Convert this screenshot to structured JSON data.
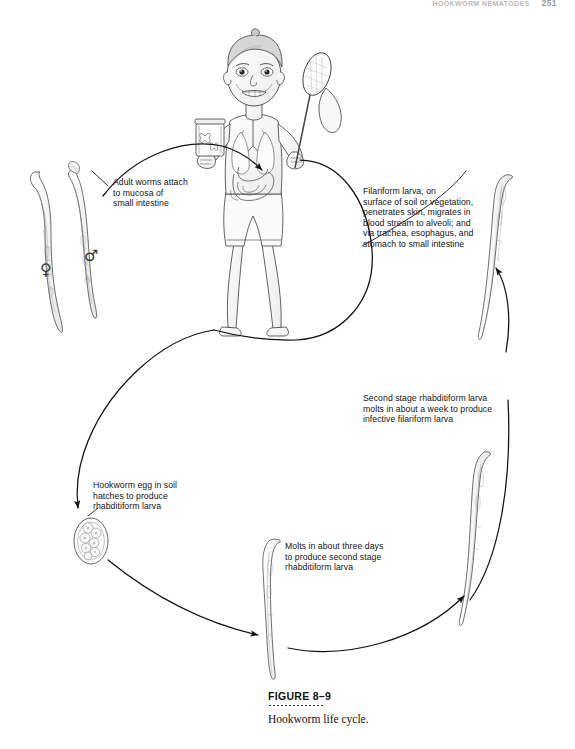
{
  "page": {
    "running_head_text": "HOOKWORM NEMATODES",
    "page_number": "251",
    "background_color": "#ffffff",
    "ink_color": "#1a1a1a"
  },
  "figure": {
    "label": "FIGURE 8–9",
    "caption": "Hookworm life cycle.",
    "title": "Hookworm life cycle"
  },
  "callouts": {
    "adult_worms": "Adult worms attach\nto mucosa of\nsmall intestine",
    "filariform": "Filariform larva, on\nsurface of soil or vegetation,\npenetrates skin, migrates in\nblood stream to alveoli; and\nvia trachea, esophagus, and\nstomach to small intestine",
    "second_stage": "Second stage rhabditiform larva\nmolts in about a week to produce\ninfective filariform larva",
    "egg_hatches": "Hookworm egg in soil\nhatches to produce\nrhabditiform larva",
    "molts_three_days": "Molts in about three days\nto produce second stage\nrhabditiform larva"
  },
  "symbols": {
    "female": "♀",
    "male": "♂",
    "female_name": "female-worm-symbol",
    "male_name": "male-worm-symbol"
  },
  "illustrations": {
    "female_worm": "adult female hookworm",
    "male_worm": "adult male hookworm",
    "boy": "boy holding butterfly jar and net with visible digestive and respiratory anatomy",
    "filariform_larva": "filariform larva",
    "infective_larva": "infective filariform larva",
    "egg": "hookworm egg containing developing cells",
    "rhabditiform_larva": "rhabditiform larva",
    "second_stage_larva": "second stage rhabditiform larva"
  }
}
